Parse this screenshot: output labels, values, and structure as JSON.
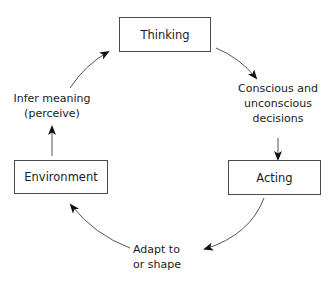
{
  "diagram": {
    "type": "cycle",
    "nodes": [
      {
        "id": "thinking",
        "label": "Thinking"
      },
      {
        "id": "acting",
        "label": "Acting"
      },
      {
        "id": "environment",
        "label": "Environment"
      }
    ],
    "edge_labels": {
      "decisions_line1": "Conscious and",
      "decisions_line2": "unconscious",
      "decisions_line3": "decisions",
      "adapt_line1": "Adapt to",
      "adapt_line2": "or shape",
      "infer_line1": "Infer meaning",
      "infer_line2": "(perceive)"
    },
    "edges": [
      {
        "from": "thinking",
        "to": "acting",
        "via": "Conscious and unconscious decisions"
      },
      {
        "from": "acting",
        "to": "environment",
        "via": "Adapt to or shape"
      },
      {
        "from": "environment",
        "to": "thinking",
        "via": "Infer meaning (perceive)"
      }
    ],
    "colors": {
      "stroke": "#4a4a4a",
      "text": "#1a1a1a",
      "background": "#ffffff"
    }
  }
}
